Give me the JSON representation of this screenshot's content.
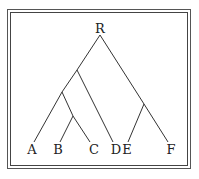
{
  "diagram": {
    "type": "tree",
    "root": "R",
    "nodes": [
      {
        "id": "R",
        "label": "R",
        "x": 100,
        "y": 28
      },
      {
        "id": "n1",
        "label": "",
        "x": 77,
        "y": 70
      },
      {
        "id": "n2",
        "label": "",
        "x": 62,
        "y": 92
      },
      {
        "id": "n3",
        "label": "",
        "x": 73,
        "y": 116
      },
      {
        "id": "n4",
        "label": "",
        "x": 144,
        "y": 104
      },
      {
        "id": "A",
        "label": "A",
        "x": 32,
        "y": 149
      },
      {
        "id": "B",
        "label": "B",
        "x": 58,
        "y": 149
      },
      {
        "id": "C",
        "label": "C",
        "x": 94,
        "y": 149
      },
      {
        "id": "D",
        "label": "D",
        "x": 116,
        "y": 149
      },
      {
        "id": "E",
        "label": "E",
        "x": 127,
        "y": 149
      },
      {
        "id": "F",
        "label": "F",
        "x": 171,
        "y": 149
      }
    ],
    "edges": [
      [
        "R",
        "n1"
      ],
      [
        "R",
        "n4"
      ],
      [
        "n1",
        "n2"
      ],
      [
        "n1",
        "D"
      ],
      [
        "n2",
        "A"
      ],
      [
        "n2",
        "n3"
      ],
      [
        "n3",
        "B"
      ],
      [
        "n3",
        "C"
      ],
      [
        "n4",
        "E"
      ],
      [
        "n4",
        "F"
      ]
    ],
    "labels": {
      "R": "R",
      "A": "A",
      "B": "B",
      "C": "C",
      "D": "D",
      "E": "E",
      "F": "F"
    }
  }
}
